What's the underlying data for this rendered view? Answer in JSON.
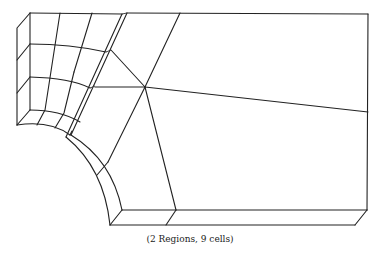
{
  "figure": {
    "caption": "(2 Regions, 9 cells)",
    "regions": 2,
    "cells": 9,
    "line_color": "#222222",
    "background": "#ffffff"
  }
}
